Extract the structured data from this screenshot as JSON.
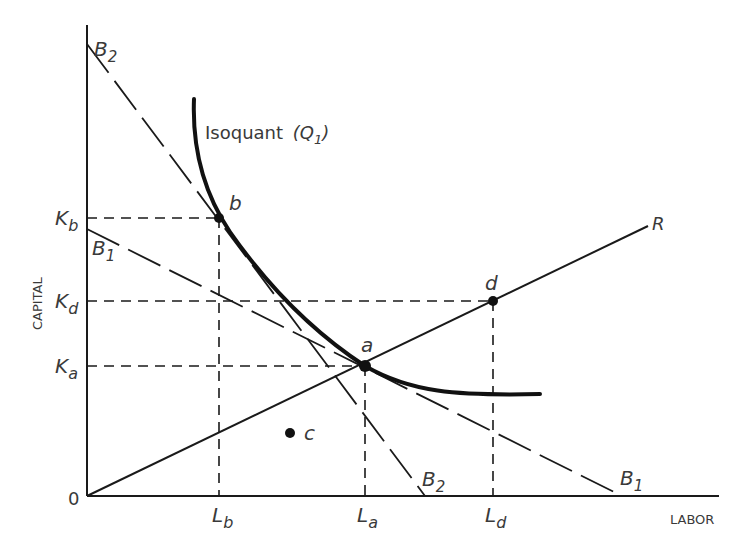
{
  "axes": {
    "x_label": "LABOR",
    "y_label": "CAPITAL",
    "origin_label": "0"
  },
  "curves": {
    "isoquant": {
      "label": "Isoquant",
      "sub_label": "(Q",
      "sub_index": "1",
      "close": ")"
    },
    "ray": {
      "label": "R"
    },
    "budget1": {
      "label": "B",
      "index": "1"
    },
    "budget2": {
      "label": "B",
      "index": "2"
    }
  },
  "points": [
    {
      "id": "a",
      "label": "a",
      "x_label": "L",
      "x_sub": "a",
      "y_label": "K",
      "y_sub": "a"
    },
    {
      "id": "b",
      "label": "b",
      "x_label": "L",
      "x_sub": "b",
      "y_label": "K",
      "y_sub": "b"
    },
    {
      "id": "c",
      "label": "c"
    },
    {
      "id": "d",
      "label": "d",
      "x_label": "L",
      "x_sub": "d",
      "y_label": "K",
      "y_sub": "d"
    }
  ],
  "y_ticks": [
    {
      "main": "K",
      "sub": "b"
    },
    {
      "main": "K",
      "sub": "d"
    },
    {
      "main": "K",
      "sub": "a"
    }
  ],
  "x_ticks": [
    {
      "main": "L",
      "sub": "b"
    },
    {
      "main": "L",
      "sub": "a"
    },
    {
      "main": "L",
      "sub": "d"
    }
  ],
  "colors": {
    "ink": "#1a1a1a",
    "text": "#3a3a3a"
  }
}
